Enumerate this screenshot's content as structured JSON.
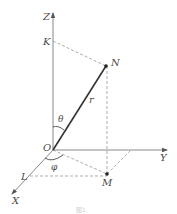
{
  "diagram": {
    "type": "spherical-coordinates",
    "colors": {
      "axis": "#7a7a7a",
      "vector": "#333333",
      "dashed": "#8a8a8a",
      "label": "#4a4a4a",
      "point": "#222222"
    },
    "axes": {
      "z": {
        "label": "Z"
      },
      "y": {
        "label": "Y"
      },
      "x": {
        "label": "X"
      }
    },
    "points": {
      "origin": {
        "label": "O"
      },
      "n": {
        "label": "N"
      },
      "m": {
        "label": "M"
      },
      "k": {
        "label": "K"
      },
      "l": {
        "label": "L"
      }
    },
    "vector": {
      "label": "r"
    },
    "angles": {
      "theta": {
        "label": "θ"
      },
      "phi": {
        "label": "φ"
      }
    },
    "caption": "图1"
  }
}
